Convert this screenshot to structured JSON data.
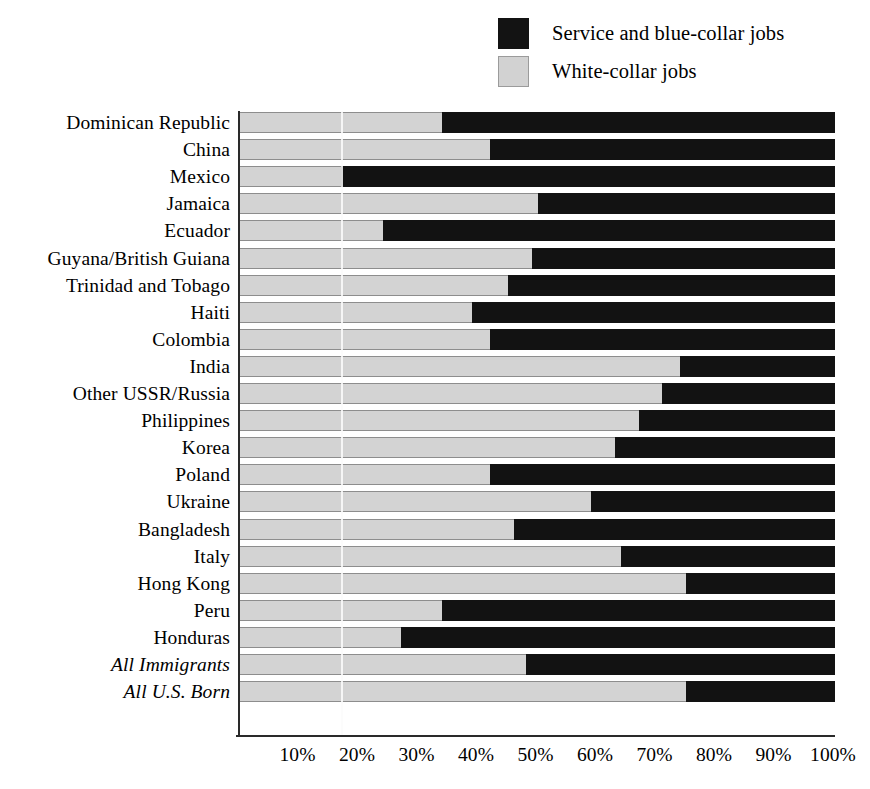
{
  "legend": {
    "position": "top-right",
    "items": [
      {
        "label": "Service and blue-collar jobs",
        "swatch": "dark-square-icon",
        "color": "#131313"
      },
      {
        "label": "White-collar jobs",
        "swatch": "light-square-icon",
        "color": "#d3d3d3"
      }
    ]
  },
  "axis": {
    "x_ticks": [
      "10%",
      "20%",
      "30%",
      "40%",
      "50%",
      "60%",
      "70%",
      "80%",
      "90%",
      "100%"
    ],
    "x_tick_values": [
      10,
      20,
      30,
      40,
      50,
      60,
      70,
      80,
      90,
      100
    ],
    "x_min": 0,
    "x_max": 100
  },
  "chart_data": {
    "type": "bar",
    "orientation": "horizontal",
    "stacked": true,
    "stack_total": 100,
    "title": "",
    "subtitle": "",
    "xlabel": "",
    "ylabel": "",
    "xlim": [
      0,
      100
    ],
    "grid": false,
    "legend_position": "top-right",
    "categories": [
      "Dominican Republic",
      "China",
      "Mexico",
      "Jamaica",
      "Ecuador",
      "Guyana/British Guiana",
      "Trinidad and Tobago",
      "Haiti",
      "Colombia",
      "India",
      "Other USSR/Russia",
      "Philippines",
      "Korea",
      "Poland",
      "Ukraine",
      "Bangladesh",
      "Italy",
      "Hong Kong",
      "Peru",
      "Honduras",
      "All Immigrants",
      "All U.S. Born"
    ],
    "category_styles": [
      "normal",
      "normal",
      "normal",
      "normal",
      "normal",
      "normal",
      "normal",
      "normal",
      "normal",
      "normal",
      "normal",
      "normal",
      "normal",
      "normal",
      "normal",
      "normal",
      "normal",
      "normal",
      "normal",
      "normal",
      "italic",
      "italic"
    ],
    "series": [
      {
        "name": "White-collar jobs",
        "color": "#d3d3d3",
        "values": [
          34,
          42,
          17,
          50,
          24,
          49,
          45,
          39,
          42,
          74,
          71,
          67,
          63,
          42,
          59,
          46,
          64,
          75,
          34,
          27,
          48,
          75
        ]
      },
      {
        "name": "Service and blue-collar jobs",
        "color": "#121212",
        "values": [
          66,
          58,
          83,
          50,
          76,
          51,
          55,
          61,
          58,
          26,
          29,
          33,
          37,
          58,
          41,
          54,
          36,
          25,
          66,
          73,
          52,
          25
        ]
      }
    ]
  }
}
